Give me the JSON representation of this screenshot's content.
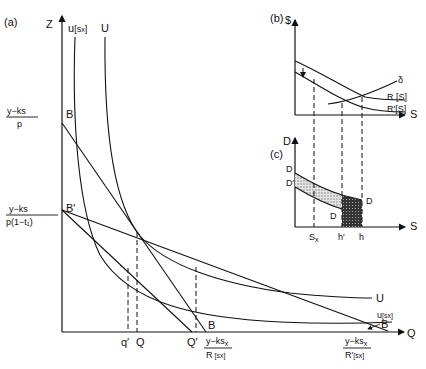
{
  "panels": {
    "a": {
      "tag": "(a)",
      "y_axis_label": "Z",
      "x_axis_label": "Q",
      "curve_labels": {
        "u_sx_top": "u[sx]",
        "U_top": "U",
        "U_right": "U",
        "u_sx_right": "u[sx]",
        "B_right": "B"
      },
      "points": {
        "B": "B",
        "B_prime": "B′",
        "B_bottom": "B"
      },
      "y_intercepts": [
        {
          "num": "y−ks",
          "den": "p"
        },
        {
          "num": "y−ks",
          "den": "p(1−t₁)"
        }
      ],
      "x_ticks": [
        "q′",
        "Q",
        "Q′"
      ],
      "x_intercepts": [
        {
          "num": "y−ks",
          "sub": "x",
          "den": "R [sx]"
        },
        {
          "num": "y−ks",
          "sub": "x",
          "den": "R′[sx]"
        }
      ]
    },
    "b": {
      "tag": "(b)",
      "y_axis_label": "$",
      "x_axis_label": "S",
      "curve_labels": [
        "δ",
        "R [S]",
        "R′[S]"
      ]
    },
    "c": {
      "tag": "(c)",
      "y_axis_label": "D",
      "x_axis_label": "S",
      "curve_labels": [
        "D",
        "D′",
        "D",
        "D"
      ],
      "x_ticks": [
        "Sx",
        "h′",
        "h"
      ]
    }
  },
  "colors": {
    "ink": "#111111",
    "background": "#ffffff",
    "light_hatch": "#cfcfcf",
    "dark_hatch": "#2a2a2a"
  }
}
